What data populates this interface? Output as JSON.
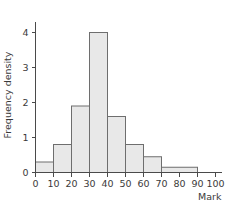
{
  "chart_data": {
    "type": "bar",
    "title": "",
    "subtitle": "",
    "xlabel": "Mark",
    "ylabel": "Frequency density",
    "xlim": [
      0,
      100
    ],
    "ylim": [
      0,
      4.3
    ],
    "grid": false,
    "legend": false,
    "legend_position": "none",
    "x_ticks": [
      0,
      10,
      20,
      30,
      40,
      50,
      60,
      70,
      80,
      90,
      100
    ],
    "x_tick_labels": [
      "0",
      "10",
      "20",
      "30",
      "40",
      "50",
      "60",
      "70",
      "80",
      "90",
      "100"
    ],
    "y_ticks": [
      0,
      1,
      2,
      3,
      4
    ],
    "y_tick_labels": [
      "0",
      "1",
      "2",
      "3",
      "4"
    ],
    "categories": [
      "0-10",
      "10-20",
      "20-30",
      "30-40",
      "40-50",
      "50-60",
      "60-70",
      "70-90",
      "90-100"
    ],
    "values": [
      0.3,
      0.8,
      1.9,
      4.0,
      1.6,
      0.8,
      0.45,
      0.15,
      0
    ],
    "bins": [
      {
        "start": 0,
        "end": 10,
        "density": 0.3
      },
      {
        "start": 10,
        "end": 20,
        "density": 0.8
      },
      {
        "start": 20,
        "end": 30,
        "density": 1.9
      },
      {
        "start": 30,
        "end": 40,
        "density": 4.0
      },
      {
        "start": 40,
        "end": 50,
        "density": 1.6
      },
      {
        "start": 50,
        "end": 60,
        "density": 0.8
      },
      {
        "start": 60,
        "end": 70,
        "density": 0.45
      },
      {
        "start": 70,
        "end": 90,
        "density": 0.15
      },
      {
        "start": 90,
        "end": 100,
        "density": 0
      }
    ],
    "colors": {
      "bar_fill": "#e8e8e8",
      "bar_stroke": "#6e6e6e",
      "axis": "#4a4a4a",
      "text": "#3a3a3a",
      "background": "#ffffff"
    }
  }
}
